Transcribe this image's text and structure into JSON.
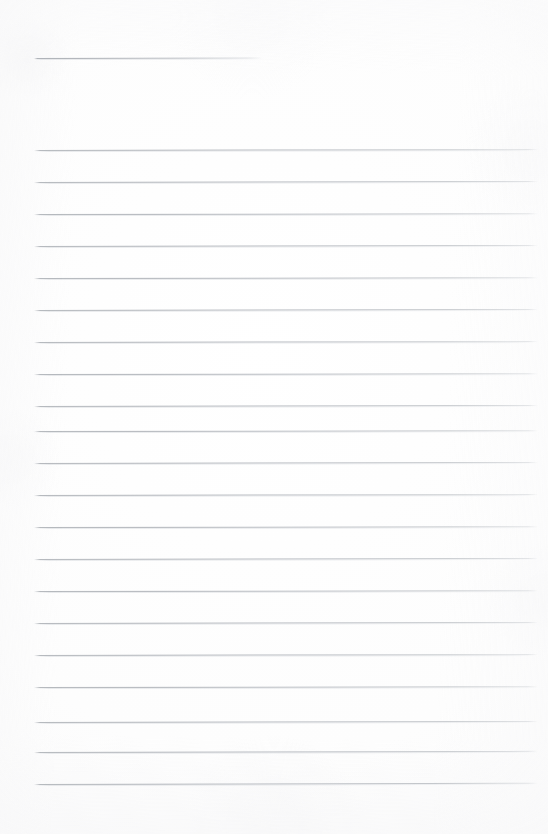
{
  "document": {
    "kind": "scanned-blank-lined-page",
    "title": "",
    "page_width": 548,
    "page_height": 834,
    "background_color": "#fdfdfd",
    "rule_color": "#b0b4b9",
    "body_text": "",
    "notes": ""
  },
  "layout": {
    "left_margin_x": 34,
    "right_edge_x": 538,
    "header_rule": {
      "label": "header-rule",
      "y": 58,
      "x_start": 34,
      "x_end": 263,
      "width": 229,
      "skew_deg": -0.12
    },
    "body_rules": {
      "label": "body-ruled-lines",
      "count": 21,
      "first_y": 150,
      "spacing": 32,
      "x_start": 34,
      "x_end": 538,
      "width": 504,
      "skew_deg": -0.1
    }
  },
  "rules": [
    {
      "name": "rule-1",
      "y": 150,
      "x": 34,
      "w": 504,
      "skew": -0.1
    },
    {
      "name": "rule-2",
      "y": 182,
      "x": 34,
      "w": 504,
      "skew": -0.12
    },
    {
      "name": "rule-3",
      "y": 214,
      "x": 34,
      "w": 504,
      "skew": -0.08
    },
    {
      "name": "rule-4",
      "y": 246,
      "x": 34,
      "w": 504,
      "skew": -0.11
    },
    {
      "name": "rule-5",
      "y": 278,
      "x": 34,
      "w": 504,
      "skew": -0.09
    },
    {
      "name": "rule-6",
      "y": 310,
      "x": 34,
      "w": 504,
      "skew": -0.12
    },
    {
      "name": "rule-7",
      "y": 342,
      "x": 34,
      "w": 504,
      "skew": -0.1
    },
    {
      "name": "rule-8",
      "y": 374,
      "x": 34,
      "w": 504,
      "skew": -0.08
    },
    {
      "name": "rule-9",
      "y": 406,
      "x": 34,
      "w": 504,
      "skew": -0.11
    },
    {
      "name": "rule-10",
      "y": 431,
      "x": 34,
      "w": 504,
      "skew": -0.09
    },
    {
      "name": "rule-11",
      "y": 463,
      "x": 34,
      "w": 504,
      "skew": -0.12
    },
    {
      "name": "rule-12",
      "y": 495,
      "x": 34,
      "w": 504,
      "skew": -0.1
    },
    {
      "name": "rule-13",
      "y": 527,
      "x": 34,
      "w": 504,
      "skew": -0.08
    },
    {
      "name": "rule-14",
      "y": 559,
      "x": 34,
      "w": 504,
      "skew": -0.11
    },
    {
      "name": "rule-15",
      "y": 591,
      "x": 34,
      "w": 504,
      "skew": -0.09
    },
    {
      "name": "rule-16",
      "y": 623,
      "x": 34,
      "w": 504,
      "skew": -0.12
    },
    {
      "name": "rule-17",
      "y": 655,
      "x": 34,
      "w": 504,
      "skew": -0.1
    },
    {
      "name": "rule-18",
      "y": 687,
      "x": 34,
      "w": 504,
      "skew": -0.08
    },
    {
      "name": "rule-19",
      "y": 722,
      "x": 34,
      "w": 504,
      "skew": -0.11
    },
    {
      "name": "rule-20",
      "y": 752,
      "x": 34,
      "w": 504,
      "skew": -0.13
    },
    {
      "name": "rule-21",
      "y": 784,
      "x": 34,
      "w": 504,
      "skew": -0.14
    }
  ]
}
